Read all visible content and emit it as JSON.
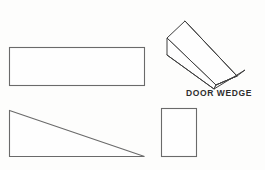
{
  "page": {
    "background_color": "#fdfdfc",
    "line_color": "#6a6a6a",
    "pictorial_line_color": "#3f3f3f",
    "width": 265,
    "height": 170
  },
  "caption": {
    "text": "DOOR WEDGE",
    "color": "#2e2e2e"
  },
  "views": {
    "top_view": {
      "name": "top-view-rectangle",
      "shape": "rectangle",
      "x": 9,
      "y": 47,
      "width": 136,
      "height": 39
    },
    "side_view": {
      "name": "side-view-triangle",
      "shape": "right-triangle",
      "points": "9,110 145,157 9,157"
    },
    "end_view": {
      "name": "end-view-rectangle",
      "shape": "rectangle",
      "x": 161,
      "y": 108,
      "width": 36,
      "height": 49
    },
    "pictorial_view": {
      "name": "pictorial-wedge",
      "shape": "wedge-3d",
      "top_face": "185,21 167,38 216,85 237,76",
      "end_face": "167,38 167,55 214,89 216,85",
      "slope_face": "216,85 214,89 244,70 237,76",
      "ridge": "216,85 237,76",
      "lower_edge": "167,55 214,89",
      "tip_edge": "237,76 244,70",
      "far_edge": "185,21 237,76"
    }
  }
}
